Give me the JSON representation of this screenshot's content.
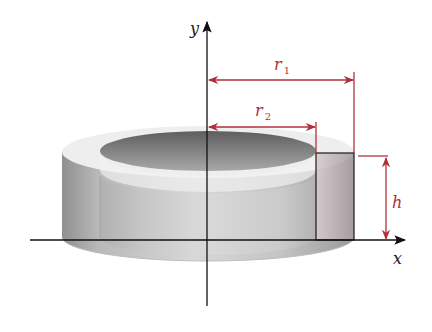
{
  "figure": {
    "axes": {
      "x_label": "x",
      "y_label": "y"
    },
    "dimensions": {
      "r1": {
        "symbol": "r",
        "subscript": "1"
      },
      "r2": {
        "symbol": "r",
        "subscript": "2"
      },
      "h": {
        "symbol": "h"
      }
    },
    "colors": {
      "dimension_red": "#b0303a",
      "axis": "#1a1a1a",
      "shell_light": "#e6e6e6",
      "shell_dark": "#8a8a8a",
      "cross_section": "#c9b6ba"
    }
  }
}
